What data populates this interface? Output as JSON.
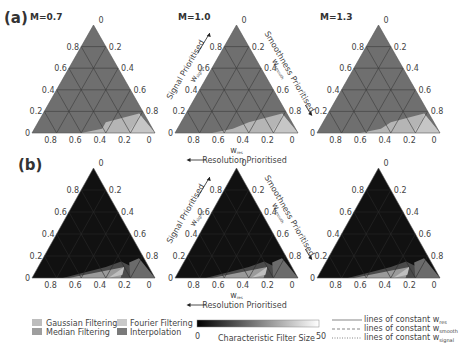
{
  "chart_data": [
    {
      "type": "ternary",
      "panel": "(a)",
      "plots": [
        {
          "title": "M=0.7",
          "background_class": "Gaussian Filtering",
          "regions": [
            {
              "class": "Fourier Filtering",
              "corner": "bottom-right",
              "extent_w_signal_max": 0.15,
              "extent_w_res_max": 0.6
            }
          ]
        },
        {
          "title": "M=1.0",
          "background_class": "Gaussian Filtering",
          "regions": [
            {
              "class": "Fourier Filtering",
              "corner": "bottom-right",
              "extent_w_signal_max": 0.15,
              "extent_w_res_max": 0.7
            }
          ]
        },
        {
          "title": "M=1.3",
          "background_class": "Gaussian Filtering",
          "regions": [
            {
              "class": "Fourier Filtering",
              "corner": "bottom-right",
              "extent_w_signal_max": 0.15,
              "extent_w_res_max": 0.65
            }
          ]
        }
      ]
    },
    {
      "type": "ternary-heatmap",
      "panel": "(b)",
      "colorbar": {
        "label": "Characteristic Filter Size",
        "min": 0,
        "max": 50
      },
      "plots": [
        {
          "title": "M=0.7",
          "dominant_value": 0,
          "bright_region": {
            "corner": "bottom-right",
            "values": [
              20,
              35,
              25
            ]
          }
        },
        {
          "title": "M=1.0",
          "dominant_value": 0,
          "bright_region": {
            "corner": "bottom-right",
            "values": [
              20,
              35,
              25
            ]
          }
        },
        {
          "title": "M=1.3",
          "dominant_value": 0,
          "bright_region": {
            "corner": "bottom-right",
            "values": [
              20,
              35,
              25
            ]
          }
        }
      ]
    }
  ],
  "axes": {
    "left_ticks": [
      "0",
      "0.2",
      "0.4",
      "0.6",
      "0.8"
    ],
    "right_ticks": [
      "0",
      "0.2",
      "0.4",
      "0.6",
      "0.8"
    ],
    "bottom_ticks": [
      "0.8",
      "0.6",
      "0.4",
      "0.2",
      "0"
    ],
    "apex_tick": "0",
    "left_axis_label": "Signal Prioritised",
    "left_axis_var": "w",
    "left_axis_sub": "signal",
    "right_axis_label": "Smoothness Prioritised",
    "right_axis_var": "w",
    "right_axis_sub": "smooth",
    "bottom_axis_var": "w",
    "bottom_axis_sub": "res",
    "bottom_axis_label": "Resolution Prioritised"
  },
  "labels": {
    "panel_a": "(a)",
    "panel_b": "(b)",
    "m_values": [
      "M=0.7",
      "M=1.0",
      "M=1.3"
    ]
  },
  "legend": {
    "classes": [
      {
        "label": "Gaussian Filtering",
        "color": "#bdbdbd"
      },
      {
        "label": "Median Filtering",
        "color": "#9e9e9e"
      },
      {
        "label": "Fourier Filtering",
        "color": "#c9c9c9"
      },
      {
        "label": "Interpolation",
        "color": "#7a7a7a"
      }
    ],
    "colorbar_label": "Characteristic Filter Size",
    "colorbar_min": "0",
    "colorbar_max": "50",
    "lines": [
      {
        "label": "lines of constant w",
        "sub": "res",
        "style": "solid"
      },
      {
        "label": "lines of constant w",
        "sub": "smooth",
        "style": "dashed"
      },
      {
        "label": "lines of constant w",
        "sub": "signal",
        "style": "dotted"
      }
    ]
  },
  "colors": {
    "panel_a_bg": "#6f6f6f",
    "panel_a_region": "#b5b5b5",
    "panel_b_bg": "#111111",
    "grid": "#3a3a3a",
    "text": "#333333"
  }
}
